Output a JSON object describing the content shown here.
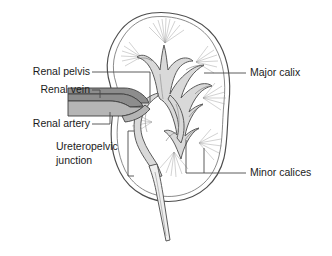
{
  "figure": {
    "background_color": "#ffffff",
    "width": 332,
    "height": 256
  },
  "labels": {
    "renal_pelvis": "Renal pelvis",
    "renal_vein": "Renal vein",
    "renal_artery": "Renal artery",
    "ureteropelvic_junction_line1": "Ureteropelvic",
    "ureteropelvic_junction_line2": "junction",
    "major_calix": "Major calix",
    "minor_calices": "Minor calices"
  },
  "colors": {
    "outline": "#4d4d4d",
    "sinus_fill": "#d9d9d9",
    "cortex_fill": "#ffffff",
    "renal_vein_fill": "#8d8d8d",
    "renal_artery_fill": "#b5b5b5",
    "leader_line": "#4a4a4a",
    "text": "#1b1b1b",
    "pyramid_ray": "#9a9a9a"
  },
  "structures": [
    {
      "name": "renal-capsule",
      "description": "Outer bean-shaped kidney capsule, double contour"
    },
    {
      "name": "renal-sinus",
      "description": "Central shaded collecting region"
    },
    {
      "name": "renal-pelvis",
      "description": "Funnel-shaped central cavity draining to ureter"
    },
    {
      "name": "major-calix",
      "description": "Large branch of the collecting system"
    },
    {
      "name": "minor-calices",
      "description": "Small cup-shaped branches capping the pyramids"
    },
    {
      "name": "renal-pyramids",
      "description": "Radiating striated medullary pyramids"
    },
    {
      "name": "renal-vein",
      "description": "Dark vessel entering the hilum, upper"
    },
    {
      "name": "renal-artery",
      "description": "Lighter vessel entering the hilum, lower"
    },
    {
      "name": "ureteropelvic-junction",
      "description": "Narrowing where pelvis meets ureter"
    },
    {
      "name": "ureter",
      "description": "Tube descending from the kidney"
    }
  ]
}
